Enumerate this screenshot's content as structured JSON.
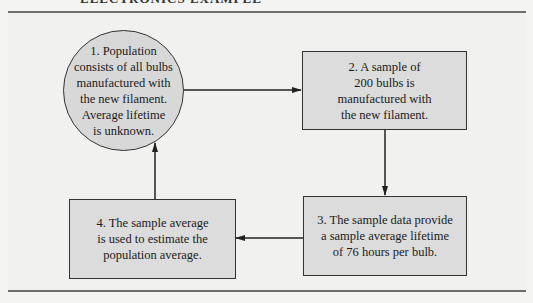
{
  "header": {
    "title": "ELECTRONICS EXAMPLE"
  },
  "diagram": {
    "nodes": [
      {
        "id": "population",
        "shape": "circle",
        "label": "1.  Population\nconsists of all bulbs\nmanufactured with\nthe new filament.\nAverage lifetime\nis unknown."
      },
      {
        "id": "sample",
        "shape": "rect",
        "label": "2.  A sample of\n200 bulbs is\nmanufactured with\nthe new filament."
      },
      {
        "id": "sample-data",
        "shape": "rect",
        "label": "3.  The sample data provide\na sample average lifetime\nof 76 hours per bulb."
      },
      {
        "id": "estimate",
        "shape": "rect",
        "label": "4.  The sample average\nis used to estimate the\npopulation average."
      }
    ],
    "edges": [
      {
        "from": "population",
        "to": "sample"
      },
      {
        "from": "sample",
        "to": "sample-data"
      },
      {
        "from": "sample-data",
        "to": "estimate"
      },
      {
        "from": "estimate",
        "to": "population"
      }
    ],
    "colors": {
      "node_fill": "#dcdcdc",
      "stroke": "#333333",
      "background": "#f1f1ef",
      "rule": "#6e6e6e"
    }
  }
}
